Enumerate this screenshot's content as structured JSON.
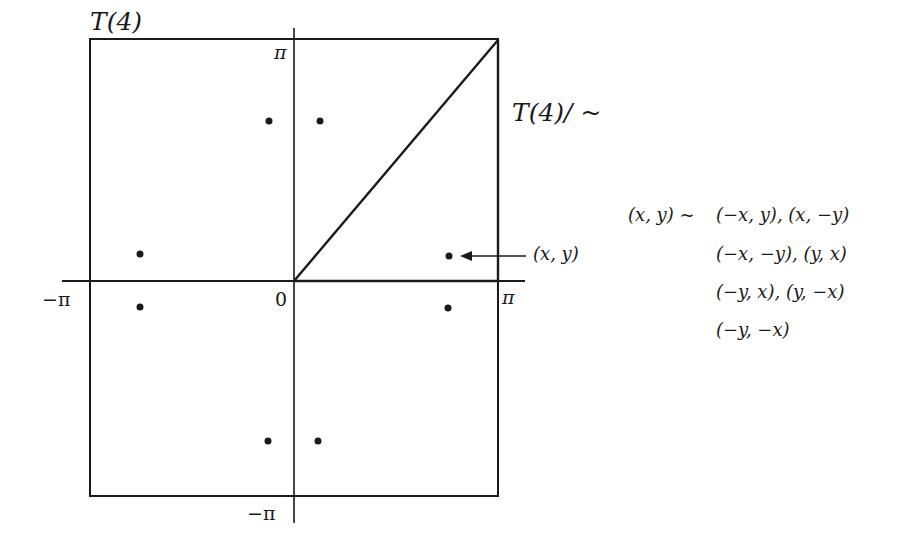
{
  "diagram": {
    "colors": {
      "ink": "#1a1a1a",
      "background": "#ffffff"
    },
    "labels": {
      "torus_label": "T(4)",
      "quotient_label": "T(4)/ ~",
      "pi_top": "π",
      "pi_right": "π",
      "neg_pi_left": "−π",
      "neg_pi_bottom": "−π",
      "origin": "0",
      "point_label": "(x, y)"
    },
    "relations": {
      "lhs": "(x, y) ~",
      "lines": [
        "(−x, y), (x, −y)",
        "(−x, −y), (y, x)",
        "(−y, x), (y, −x)",
        "(−y, −x)"
      ]
    },
    "square": {
      "x_range": [
        "-π",
        "π"
      ],
      "y_range": [
        "-π",
        "π"
      ]
    },
    "points": [
      {
        "x": -0.15,
        "y": 0.72
      },
      {
        "x": 0.15,
        "y": 0.72
      },
      {
        "x": -0.72,
        "y": 0.12
      },
      {
        "x": 0.75,
        "y": 0.12
      },
      {
        "x": -0.72,
        "y": -0.12
      },
      {
        "x": 0.75,
        "y": -0.12
      },
      {
        "x": -0.15,
        "y": -0.72
      },
      {
        "x": 0.12,
        "y": -0.72
      }
    ],
    "fundamental_domain": "triangle from (0,0) to (π,0) to (π,π)"
  }
}
